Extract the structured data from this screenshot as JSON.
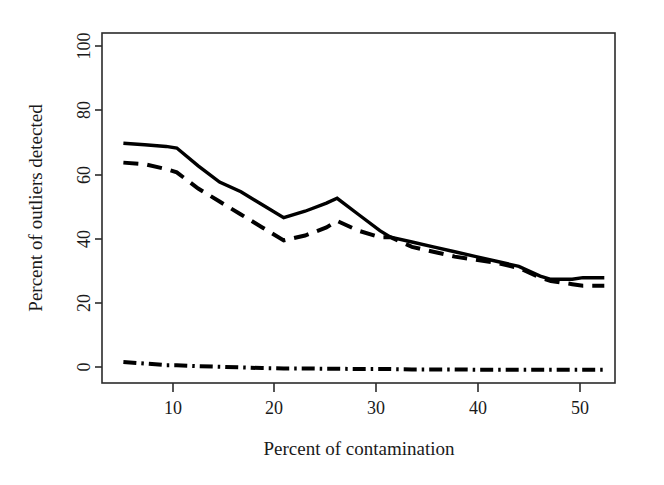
{
  "chart_data": {
    "type": "line",
    "title": "",
    "subtitle": "",
    "xlabel": "Percent of contamination",
    "ylabel": "Percent of outliers detected",
    "xlim": [
      3,
      51
    ],
    "ylim": [
      -4,
      104
    ],
    "xticks": [
      10,
      20,
      30,
      40,
      50
    ],
    "xtick_labels": [
      "10",
      "20",
      "30",
      "40",
      "50"
    ],
    "yticks": [
      0,
      20,
      40,
      60,
      80,
      100
    ],
    "ytick_labels": [
      "0",
      "20",
      "40",
      "60",
      "80",
      "100"
    ],
    "grid": false,
    "legend": "none",
    "x": [
      5,
      7,
      9,
      10,
      12,
      14,
      16,
      18,
      20,
      22,
      24,
      25,
      27,
      29,
      30,
      32,
      34,
      36,
      38,
      40,
      42,
      44,
      45,
      47,
      48,
      50
    ],
    "series": [
      {
        "name": "solid-series",
        "style": "solid",
        "values": [
          70,
          69.5,
          69,
          68.5,
          63,
          58,
          55,
          51,
          47,
          49,
          51.5,
          53,
          48,
          43,
          41,
          39.5,
          38,
          36.5,
          35,
          33.5,
          32,
          29,
          28,
          28,
          28.5,
          28.5
        ]
      },
      {
        "name": "dashed-series",
        "style": "dashed",
        "values": [
          64,
          63.5,
          62,
          61,
          56,
          52,
          48,
          44,
          40,
          41.5,
          44,
          46,
          43,
          41,
          41,
          38,
          36.5,
          35,
          34,
          33,
          31.5,
          28.5,
          27.5,
          26.5,
          26,
          26
        ]
      },
      {
        "name": "dash-dot-series",
        "style": "dashdot",
        "values": [
          2.5,
          2,
          1.5,
          1.5,
          1.2,
          1,
          0.8,
          0.6,
          0.5,
          0.5,
          0.4,
          0.4,
          0.3,
          0.3,
          0.3,
          0.2,
          0.2,
          0.2,
          0.1,
          0.1,
          0.1,
          0.1,
          0.1,
          0.1,
          0.1,
          0.1
        ]
      }
    ]
  },
  "figure": {
    "x_axis_title": "Percent of contamination",
    "y_axis_title": "Percent of outliers detected"
  }
}
